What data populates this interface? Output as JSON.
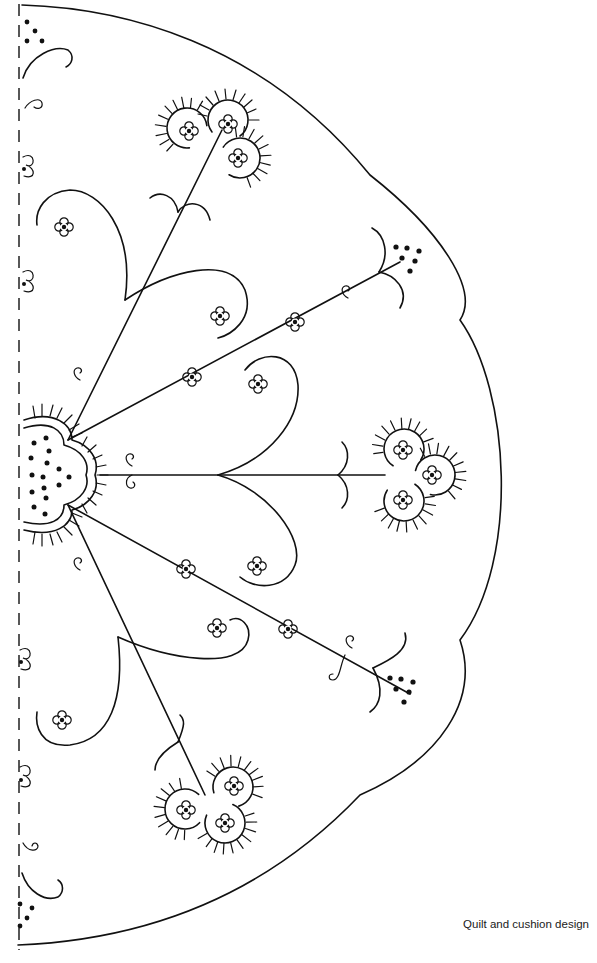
{
  "caption": "Quilt and cushion design",
  "design": {
    "type": "embroidery-pattern",
    "outline": "scalloped half-circle",
    "fold_line": "dashed, left edge",
    "line_color": "#111111",
    "background_color": "#ffffff",
    "motifs": {
      "center_hub": "trefoil with radiating stitches and 15 french-knot dots",
      "stems": 5,
      "trefoil_flowers": 3,
      "dot_clusters": 4,
      "small_four_petal_flowers": 12
    }
  }
}
